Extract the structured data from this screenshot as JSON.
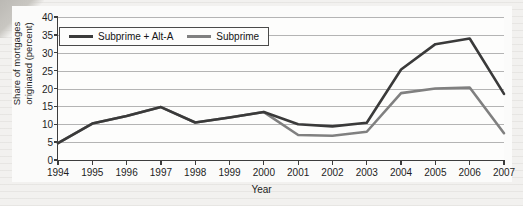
{
  "chart_data": {
    "type": "line",
    "title": "",
    "xlabel": "Year",
    "ylabel": "Share of mortgages\noriginated (percent)",
    "x": [
      1994,
      1995,
      1996,
      1997,
      1998,
      1999,
      2000,
      2001,
      2002,
      2003,
      2004,
      2005,
      2006,
      2007
    ],
    "xtick_labels": [
      "1994",
      "1995",
      "1996",
      "1997",
      "1998",
      "1999",
      "2000",
      "2001",
      "2002",
      "2003",
      "2004",
      "2005",
      "2006",
      "2007"
    ],
    "ytick_labels": [
      "0",
      "5",
      "10",
      "15",
      "20",
      "25",
      "30",
      "35",
      "40"
    ],
    "yticks": [
      0,
      5,
      10,
      15,
      20,
      25,
      30,
      35,
      40
    ],
    "ylim": [
      0,
      40
    ],
    "xlim": [
      1994,
      2007
    ],
    "grid": "horizontal",
    "legend_position": "upper-left-inside",
    "series": [
      {
        "name": "Subprime + Alt-A",
        "color": "#3a3a3a",
        "values": [
          4.7,
          10.2,
          12.3,
          14.8,
          10.5,
          11.9,
          13.4,
          10.0,
          9.4,
          10.4,
          25.3,
          32.4,
          34.0,
          18.5
        ]
      },
      {
        "name": "Subprime",
        "color": "#808080",
        "values": [
          4.7,
          10.2,
          12.3,
          14.8,
          10.5,
          11.9,
          13.4,
          7.0,
          6.8,
          7.9,
          18.7,
          20.0,
          20.3,
          7.5
        ]
      }
    ]
  },
  "legend": {
    "items": [
      {
        "label": "Subprime + Alt-A",
        "color": "#3a3a3a"
      },
      {
        "label": "Subprime",
        "color": "#808080"
      }
    ]
  },
  "axes": {
    "x_title": "Year",
    "y_title": "Share of mortgages\noriginated (percent)"
  }
}
